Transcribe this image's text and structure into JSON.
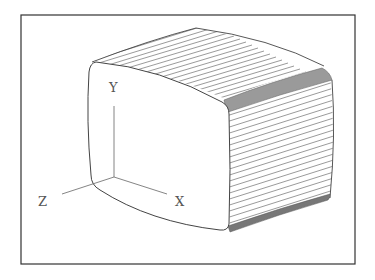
{
  "figure": {
    "title": "",
    "frame_color": "#333333",
    "line_color": "#555555",
    "axes": {
      "x_label": "X",
      "y_label": "Y",
      "z_label": "Z"
    },
    "object": {
      "shape": "rounded-box",
      "front_face": "blank",
      "top_face_hatch_lines": 19,
      "side_face_hatch_lines": 20
    }
  }
}
